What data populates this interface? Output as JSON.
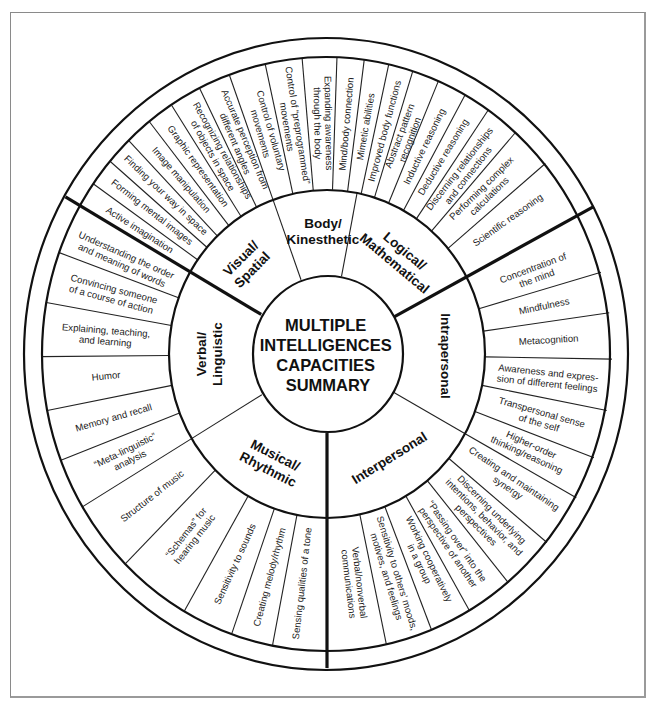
{
  "title_lines": [
    "MULTIPLE",
    "INTELLIGENCES",
    "CAPACITIES",
    "SUMMARY"
  ],
  "categories": [
    {
      "name": "visual-spatial",
      "label_lines": [
        "Visual/",
        "Spatial"
      ],
      "label_angle": -133,
      "label_rotate": -45,
      "items": [
        {
          "angle": -147.5,
          "lines": [
            "Active imagination"
          ]
        },
        {
          "angle": -142,
          "lines": [
            "Forming mental images"
          ]
        },
        {
          "angle": -136.5,
          "lines": [
            "Finding your way in space"
          ]
        },
        {
          "angle": -131,
          "lines": [
            "Image manipulation"
          ]
        },
        {
          "angle": -125.5,
          "lines": [
            "Graphic representation"
          ]
        },
        {
          "angle": -119.5,
          "lines": [
            "Recognizing relationships",
            "of objects in space"
          ]
        },
        {
          "angle": -113,
          "lines": [
            "Accurate perception from",
            "different angles"
          ]
        }
      ]
    },
    {
      "name": "body-kinesthetic",
      "label_lines": [
        "Body/",
        "Kinesthetic"
      ],
      "label_angle": -92,
      "label_rotate": 0,
      "items": [
        {
          "angle": -106,
          "lines": [
            "Control of voluntary",
            "movements"
          ]
        },
        {
          "angle": -99,
          "lines": [
            "Control of “preprogrammed”",
            "movements"
          ]
        },
        {
          "angle": -91,
          "lines": [
            "Expanding awareness",
            "through the body"
          ]
        },
        {
          "angle": -85,
          "lines": [
            "Mind/body connection"
          ]
        },
        {
          "angle": -80,
          "lines": [
            "Mimetic abilities"
          ]
        },
        {
          "angle": -75,
          "lines": [
            "Improved body functions"
          ]
        }
      ]
    },
    {
      "name": "logical-mathematical",
      "label_lines": [
        "Logical/",
        "Mathematical"
      ],
      "label_angle": -52,
      "label_rotate": 40,
      "items": [
        {
          "angle": -69.5,
          "lines": [
            "Abstract pattern",
            "recognition"
          ]
        },
        {
          "angle": -64,
          "lines": [
            "Inductive reasoning"
          ]
        },
        {
          "angle": -58.5,
          "lines": [
            "Deductive reasoning"
          ]
        },
        {
          "angle": -52,
          "lines": [
            "Discerning relationships",
            "and connections"
          ]
        },
        {
          "angle": -44.5,
          "lines": [
            "Performing complex",
            "calculations"
          ]
        },
        {
          "angle": -35.5,
          "lines": [
            "Scientific reasoning"
          ]
        }
      ]
    },
    {
      "name": "intrapersonal",
      "label_lines": [
        "Intrapersonal"
      ],
      "label_angle": 1,
      "label_rotate": 90,
      "items": [
        {
          "angle": -20.5,
          "lines": [
            "Concentration of",
            "the mind"
          ]
        },
        {
          "angle": -12,
          "lines": [
            "Mindfulness"
          ]
        },
        {
          "angle": -3.5,
          "lines": [
            "Metacognition"
          ]
        },
        {
          "angle": 6,
          "lines": [
            "Awareness and expres-",
            "sion of different feelings"
          ]
        },
        {
          "angle": 16,
          "lines": [
            "Transpersonal sense",
            "of the self"
          ]
        },
        {
          "angle": 24.5,
          "lines": [
            "Higher-order",
            "thinking/reasoning"
          ]
        }
      ]
    },
    {
      "name": "interpersonal",
      "label_lines": [
        "Interpersonal"
      ],
      "label_angle": 58,
      "label_rotate": -32,
      "items": [
        {
          "angle": 34,
          "lines": [
            "Creating and maintaining",
            "synergy"
          ]
        },
        {
          "angle": 45,
          "lines": [
            "Discerning underlying",
            "intentions, behavior, and",
            "perspectives"
          ]
        },
        {
          "angle": 55.5,
          "lines": [
            "“Passing over” into the",
            "perspective of another"
          ]
        },
        {
          "angle": 64,
          "lines": [
            "Working cooperatively",
            "in a group"
          ]
        },
        {
          "angle": 73,
          "lines": [
            "Sensitivity to others’ moods,",
            "motives, and feelings"
          ]
        },
        {
          "angle": 83,
          "lines": [
            "Verbal/nonverbal",
            "communications"
          ]
        }
      ]
    },
    {
      "name": "musical-rhythmic",
      "label_lines": [
        "Musical/",
        "Rhythmic"
      ],
      "label_angle": 118,
      "label_rotate": 27,
      "items": [
        {
          "angle": 96.5,
          "lines": [
            "Sensing qualities of a tone"
          ]
        },
        {
          "angle": 105,
          "lines": [
            "Creating melody/rhythm"
          ]
        },
        {
          "angle": 114.5,
          "lines": [
            "Sensitivity to sounds"
          ]
        },
        {
          "angle": 128,
          "lines": [
            "“Schemas” for",
            "hearing music"
          ]
        },
        {
          "angle": 142,
          "lines": [
            "Structure of music"
          ]
        }
      ]
    },
    {
      "name": "verbal-linguistic",
      "label_lines": [
        "Verbal/",
        "Linguistic"
      ],
      "label_angle": 180,
      "label_rotate": -90,
      "items": [
        {
          "angle": 154,
          "lines": [
            "“Meta-linguistic”",
            "analysis"
          ]
        },
        {
          "angle": 164,
          "lines": [
            "Memory and recall"
          ]
        },
        {
          "angle": 174.5,
          "lines": [
            "Humor"
          ]
        },
        {
          "angle": 184.5,
          "lines": [
            "Explaining, teaching,",
            "and learning"
          ]
        },
        {
          "angle": 195,
          "lines": [
            "Convincing someone",
            "of a course of action"
          ]
        },
        {
          "angle": 204,
          "lines": [
            "Understanding the order",
            "and meaning of words"
          ]
        }
      ]
    }
  ],
  "item_dividers": [
    -150,
    -145,
    -139.5,
    -134,
    -128.5,
    -123,
    -116.5,
    -110,
    -102.5,
    -95,
    -88,
    -82.5,
    -77.5,
    -72.5,
    -67,
    -61,
    -55.5,
    -48.5,
    -40,
    -28,
    -16,
    -8,
    1,
    11,
    20.5,
    29,
    39.5,
    50.5,
    60,
    68.5,
    78,
    90,
    101,
    109.5,
    120,
    135,
    149,
    159,
    169,
    179.5,
    190,
    200
  ],
  "heavy_dividers": [
    -150,
    -28,
    90
  ],
  "category_dividers_thin": [
    -110,
    -79,
    29,
    149
  ],
  "colors": {
    "ink": "#111111",
    "paper": "#ffffff",
    "frame": "#8a8a8a"
  }
}
